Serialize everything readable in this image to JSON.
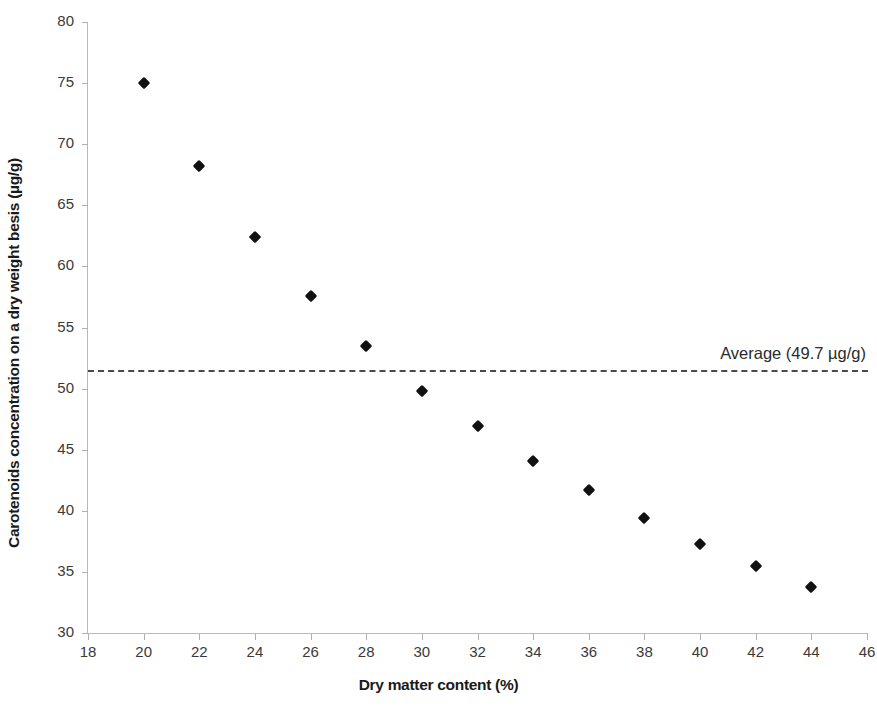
{
  "chart_data": {
    "type": "scatter",
    "title": "",
    "xlabel": "Dry matter content (%)",
    "ylabel": "Carotenoids concentration on a dry weight besis (µg/g)",
    "xlim": [
      18,
      46
    ],
    "ylim": [
      30,
      80
    ],
    "xticks": [
      18,
      20,
      22,
      24,
      26,
      28,
      30,
      32,
      34,
      36,
      38,
      40,
      42,
      44,
      46
    ],
    "yticks": [
      30,
      35,
      40,
      45,
      50,
      55,
      60,
      65,
      70,
      75,
      80
    ],
    "xtick_labels": [
      "18",
      "20",
      "22",
      "24",
      "26",
      "28",
      "30",
      "32",
      "34",
      "36",
      "38",
      "40",
      "42",
      "44",
      "46"
    ],
    "ytick_labels": [
      "30",
      "35",
      "40",
      "45",
      "50",
      "55",
      "60",
      "65",
      "70",
      "75",
      "80"
    ],
    "grid": false,
    "legend": null,
    "marker": "diamond",
    "marker_color": "#111111",
    "x": [
      20,
      22,
      24,
      26,
      28,
      30,
      32,
      34,
      36,
      38,
      40,
      42,
      44
    ],
    "y": [
      75.0,
      68.2,
      62.4,
      57.6,
      53.5,
      49.8,
      46.9,
      44.1,
      41.7,
      39.4,
      37.3,
      35.5,
      33.8
    ],
    "points": [
      {
        "x": 20,
        "y": 75.0
      },
      {
        "x": 22,
        "y": 68.2
      },
      {
        "x": 24,
        "y": 62.4
      },
      {
        "x": 26,
        "y": 57.6
      },
      {
        "x": 28,
        "y": 53.5
      },
      {
        "x": 30,
        "y": 49.8
      },
      {
        "x": 32,
        "y": 46.9
      },
      {
        "x": 34,
        "y": 44.1
      },
      {
        "x": 36,
        "y": 41.7
      },
      {
        "x": 38,
        "y": 39.4
      },
      {
        "x": 40,
        "y": 37.3
      },
      {
        "x": 42,
        "y": 35.5
      },
      {
        "x": 44,
        "y": 33.8
      }
    ],
    "annotations": [
      {
        "name": "average-line",
        "label": "Average (49.7 µg/g)",
        "value": 49.7,
        "style": "dashed",
        "color": "#4a4a4a",
        "orientation": "horizontal",
        "drawn_y": 51.5
      }
    ]
  }
}
